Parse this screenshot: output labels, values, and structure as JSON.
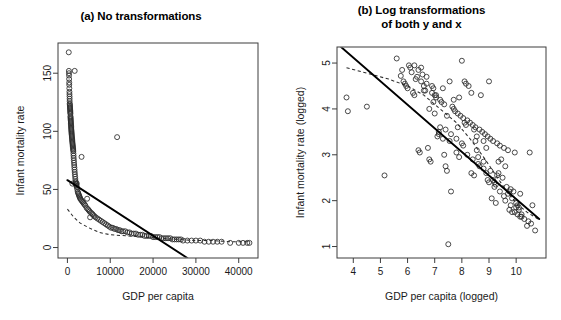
{
  "figure": {
    "width": 561,
    "height": 320,
    "background": "#ffffff",
    "ink_color": "#1a1a1a"
  },
  "panels": [
    {
      "id": "a",
      "title": "(a) No transformations",
      "title_lines": [
        "(a) No transformations"
      ]
    },
    {
      "id": "b",
      "title": "(b) Log transformations of both y and x",
      "title_lines": [
        "(b) Log transformations",
        "of both y and x"
      ]
    }
  ],
  "chart_data": [
    {
      "type": "scatter",
      "panel": "a",
      "title": "(a) No transformations",
      "xlabel": "GDP per capita",
      "ylabel": "Infant mortality rate",
      "xlim": [
        -2200,
        44500
      ],
      "ylim": [
        -9,
        176
      ],
      "xticks": [
        0,
        10000,
        20000,
        30000,
        40000
      ],
      "xticklabels": [
        "0",
        "10000",
        "20000",
        "30000",
        "40000"
      ],
      "yticks": [
        0,
        50,
        100,
        150
      ],
      "yticklabels": [
        "0",
        "50",
        "100",
        "150"
      ],
      "grid": false,
      "legend": "none",
      "marker": "open-circle",
      "x": [
        310,
        340,
        360,
        380,
        400,
        420,
        430,
        450,
        470,
        480,
        500,
        510,
        520,
        540,
        560,
        580,
        600,
        610,
        630,
        650,
        660,
        680,
        700,
        710,
        730,
        750,
        760,
        780,
        800,
        810,
        830,
        850,
        870,
        880,
        900,
        920,
        940,
        960,
        980,
        1000,
        1020,
        1050,
        1080,
        1100,
        1120,
        1150,
        1180,
        1200,
        1230,
        1260,
        1290,
        1320,
        1350,
        1380,
        1400,
        1430,
        1460,
        1500,
        1540,
        1580,
        1620,
        1660,
        1700,
        1750,
        1800,
        1850,
        1900,
        1950,
        2000,
        2050,
        2100,
        2200,
        2300,
        2400,
        2500,
        2600,
        2700,
        2800,
        2900,
        3000,
        3200,
        3400,
        3600,
        3800,
        4000,
        4200,
        4500,
        4800,
        5000,
        5200,
        5500,
        5800,
        6000,
        6300,
        6600,
        7000,
        7400,
        7800,
        8200,
        8600,
        9000,
        9400,
        9800,
        10200,
        10600,
        11000,
        11400,
        11800,
        12200,
        12600,
        13000,
        13500,
        14000,
        14500,
        15000,
        15500,
        16000,
        16500,
        17000,
        17500,
        18000,
        18500,
        19000,
        19500,
        20000,
        20500,
        21000,
        21500,
        22000,
        22500,
        23000,
        23500,
        24000,
        24500,
        25000,
        25500,
        26000,
        26500,
        27000,
        28000,
        29000,
        30000,
        31000,
        32000,
        33000,
        34000,
        35000,
        36000,
        38000,
        40000,
        41000,
        42000,
        42500,
        1150,
        2200,
        3300,
        4600,
        5300,
        11600,
        1700
      ],
      "y": [
        168,
        152,
        150,
        148,
        145,
        142,
        140,
        137,
        134,
        132,
        130,
        128,
        126,
        124,
        123,
        122,
        121,
        120,
        119,
        118,
        117,
        116,
        115,
        113,
        112,
        111,
        110,
        109,
        108,
        107,
        106,
        105,
        104,
        103,
        102,
        101,
        100,
        99,
        98,
        97,
        96,
        95,
        94,
        93,
        92,
        91,
        90,
        89,
        88,
        87,
        86,
        85,
        84,
        83,
        81,
        79,
        77,
        75,
        73,
        71,
        69,
        67,
        65,
        63,
        61,
        59,
        57,
        56,
        55,
        54,
        53,
        52,
        50,
        48,
        47,
        46,
        45,
        44,
        43,
        42,
        41,
        40,
        39,
        38,
        37,
        36,
        34,
        33,
        32,
        31,
        30,
        29,
        28,
        27,
        26,
        25,
        24,
        23,
        22,
        21,
        20,
        19,
        18,
        17,
        17,
        16,
        16,
        15,
        15,
        14,
        14,
        14,
        13,
        13,
        12,
        12,
        12,
        11,
        11,
        11,
        10,
        10,
        10,
        10,
        9,
        9,
        9,
        9,
        8,
        8,
        8,
        8,
        8,
        7,
        7,
        7,
        7,
        7,
        6,
        6,
        6,
        6,
        6,
        5,
        5,
        5,
        5,
        5,
        4,
        4,
        4,
        4,
        4,
        55,
        55,
        78,
        42,
        26,
        95,
        152
      ],
      "fit_line": {
        "type": "linear",
        "style": "solid",
        "x0": 0,
        "y0": 58,
        "x1": 28000,
        "y1": -9
      },
      "smooth_line": {
        "type": "lowess",
        "style": "dashed",
        "points": [
          [
            0,
            33
          ],
          [
            1500,
            26
          ],
          [
            3000,
            21
          ],
          [
            5000,
            17
          ],
          [
            7500,
            13
          ],
          [
            10000,
            11
          ],
          [
            14000,
            10
          ],
          [
            18000,
            9
          ],
          [
            22000,
            8
          ],
          [
            26000,
            7
          ],
          [
            30000,
            6
          ],
          [
            34000,
            6
          ],
          [
            38000,
            5
          ],
          [
            42500,
            5
          ]
        ]
      }
    },
    {
      "type": "scatter",
      "panel": "b",
      "title": "(b) Log transformations of both y and x",
      "xlabel": "GDP per capita (logged)",
      "ylabel": "Infant mortality rate (logged)",
      "xlim": [
        3.4,
        11.1
      ],
      "ylim": [
        0.75,
        5.35
      ],
      "xticks": [
        4,
        5,
        6,
        7,
        8,
        9,
        10
      ],
      "xticklabels": [
        "4",
        "5",
        "6",
        "7",
        "8",
        "9",
        "10"
      ],
      "yticks": [
        1,
        2,
        3,
        4,
        5
      ],
      "yticklabels": [
        "1",
        "2",
        "3",
        "4",
        "5"
      ],
      "grid": false,
      "legend": "none",
      "marker": "open-circle",
      "x": [
        3.75,
        3.8,
        4.5,
        5.15,
        5.6,
        5.75,
        5.8,
        5.85,
        5.9,
        5.95,
        6.0,
        6.05,
        6.1,
        6.15,
        6.2,
        6.25,
        6.3,
        6.35,
        6.4,
        6.45,
        6.5,
        6.55,
        6.6,
        6.65,
        6.7,
        6.75,
        6.8,
        6.85,
        6.9,
        6.95,
        7.0,
        7.05,
        7.1,
        7.15,
        7.2,
        7.25,
        7.3,
        7.35,
        7.4,
        7.45,
        7.5,
        7.55,
        7.6,
        7.65,
        7.7,
        7.75,
        7.8,
        7.85,
        7.9,
        7.95,
        8.0,
        8.05,
        8.1,
        8.15,
        8.2,
        8.25,
        8.3,
        8.35,
        8.4,
        8.45,
        8.5,
        8.55,
        8.6,
        8.65,
        8.7,
        8.75,
        8.8,
        8.85,
        8.9,
        8.95,
        9.0,
        9.05,
        9.1,
        9.15,
        9.2,
        9.25,
        9.3,
        9.35,
        9.4,
        9.45,
        9.5,
        9.55,
        9.6,
        9.65,
        9.7,
        9.75,
        9.8,
        9.85,
        9.9,
        9.95,
        10.0,
        10.05,
        10.1,
        10.15,
        10.2,
        10.3,
        10.4,
        10.5,
        10.6,
        10.7,
        6.4,
        6.6,
        6.8,
        7.0,
        7.2,
        7.4,
        7.6,
        7.8,
        8.0,
        8.2,
        8.4,
        8.6,
        8.8,
        9.0,
        9.2,
        9.4,
        9.6,
        9.8,
        10.0,
        10.2,
        6.5,
        6.9,
        7.3,
        7.7,
        8.1,
        8.5,
        8.9,
        9.3,
        9.7,
        10.1,
        7.45,
        8.35,
        9.15,
        9.95,
        6.7,
        7.9,
        8.65,
        9.55,
        10.45,
        8.8,
        6.25,
        7.05,
        7.85,
        8.55,
        9.35,
        10.15,
        6.95,
        8.15,
        9.05,
        9.85,
        7.55,
        8.45,
        9.25,
        10.05,
        7.15,
        8.05,
        8.95,
        9.75,
        10.55,
        7.35
      ],
      "y": [
        4.25,
        3.95,
        4.05,
        2.55,
        5.1,
        4.72,
        4.85,
        4.6,
        4.55,
        4.5,
        4.45,
        4.95,
        4.9,
        4.8,
        4.35,
        4.3,
        4.65,
        4.7,
        3.1,
        3.05,
        4.6,
        4.75,
        4.5,
        4.4,
        4.55,
        3.15,
        2.9,
        2.85,
        4.35,
        4.45,
        4.3,
        4.25,
        3.4,
        3.5,
        4.2,
        4.15,
        3.35,
        4.1,
        2.75,
        2.65,
        1.05,
        3.3,
        2.2,
        4.05,
        4.0,
        3.95,
        3.05,
        3.9,
        2.95,
        3.85,
        5.05,
        3.8,
        4.6,
        4.55,
        3.75,
        4.5,
        3.7,
        2.6,
        3.65,
        2.55,
        3.6,
        3.1,
        2.95,
        3.55,
        4.3,
        3.5,
        2.85,
        3.45,
        2.6,
        3.4,
        4.6,
        3.35,
        2.05,
        3.3,
        2.4,
        1.95,
        3.25,
        2.85,
        3.2,
        2.9,
        2.5,
        3.15,
        2.75,
        2.3,
        3.1,
        1.8,
        2.25,
        1.75,
        2.2,
        3.05,
        1.95,
        1.7,
        1.85,
        2.15,
        1.65,
        1.6,
        1.45,
        3.05,
        1.9,
        1.35,
        4.85,
        4.4,
        4.0,
        3.9,
        3.6,
        3.55,
        3.45,
        3.35,
        3.25,
        3.0,
        2.9,
        2.8,
        2.7,
        2.4,
        2.3,
        2.2,
        2.0,
        1.9,
        1.85,
        1.7,
        4.9,
        4.5,
        4.45,
        4.2,
        3.7,
        3.3,
        3.15,
        2.55,
        2.15,
        1.8,
        3.85,
        4.35,
        2.45,
        1.75,
        4.7,
        4.25,
        2.75,
        2.1,
        1.55,
        3.3,
        4.95,
        4.3,
        3.6,
        3.4,
        2.6,
        1.65,
        4.15,
        3.65,
        2.65,
        2.05,
        4.6,
        3.55,
        2.35,
        1.9,
        3.45,
        3.2,
        2.45,
        2.2,
        1.5,
        3.0
      ],
      "fit_line": {
        "type": "linear",
        "style": "solid",
        "x0": 3.55,
        "y0": 5.35,
        "x1": 10.85,
        "y1": 1.6
      },
      "smooth_line": {
        "type": "lowess",
        "style": "dashed",
        "points": [
          [
            3.75,
            4.9
          ],
          [
            4.5,
            4.78
          ],
          [
            5.3,
            4.65
          ],
          [
            6.0,
            4.5
          ],
          [
            6.6,
            4.3
          ],
          [
            7.2,
            4.0
          ],
          [
            7.8,
            3.7
          ],
          [
            8.3,
            3.35
          ],
          [
            8.8,
            2.95
          ],
          [
            9.2,
            2.6
          ],
          [
            9.6,
            2.25
          ],
          [
            10.0,
            1.95
          ],
          [
            10.4,
            1.75
          ],
          [
            10.8,
            1.6
          ]
        ]
      }
    }
  ]
}
